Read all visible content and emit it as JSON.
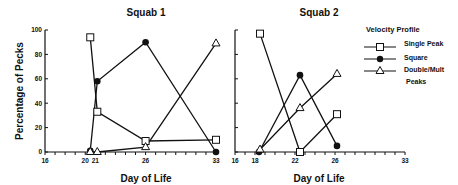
{
  "chart_data": [
    {
      "type": "line",
      "title": "Squab 1",
      "xlabel": "Day of Life",
      "ylabel": "Percentage of Pecks",
      "xlim": [
        16,
        33
      ],
      "ylim": [
        0,
        100
      ],
      "xticks": [
        16,
        20,
        21,
        26,
        33
      ],
      "yticks": [
        0,
        20,
        40,
        60,
        80,
        100
      ],
      "grid": false,
      "series": [
        {
          "name": "Single Peak",
          "marker": "open-square",
          "x": [
            20.5,
            21.2,
            26,
            33
          ],
          "values": [
            94,
            33,
            9,
            10
          ]
        },
        {
          "name": "Square",
          "marker": "filled-circle",
          "x": [
            20.5,
            21.2,
            26,
            33
          ],
          "values": [
            1,
            58,
            90,
            0
          ]
        },
        {
          "name": "Double/Mult Peaks",
          "marker": "open-triangle",
          "x": [
            20.5,
            21.2,
            26,
            33
          ],
          "values": [
            0,
            0,
            4,
            89
          ]
        }
      ]
    },
    {
      "type": "line",
      "title": "Squab 2",
      "xlabel": "Day of Life",
      "ylabel": "",
      "xlim": [
        16,
        33
      ],
      "ylim": [
        0,
        100
      ],
      "xticks": [
        16,
        18,
        22,
        26,
        33
      ],
      "yticks": [
        0,
        20,
        40,
        60,
        80,
        100
      ],
      "grid": false,
      "legend_position": "right",
      "series": [
        {
          "name": "Single Peak",
          "marker": "open-square",
          "x": [
            18.5,
            22.5,
            26.2
          ],
          "values": [
            97,
            0,
            31
          ]
        },
        {
          "name": "Square",
          "marker": "filled-circle",
          "x": [
            18.4,
            22.5,
            26.2
          ],
          "values": [
            0,
            63,
            5
          ]
        },
        {
          "name": "Double/Mult Peaks",
          "marker": "open-triangle",
          "x": [
            18.5,
            22.5,
            26.2
          ],
          "values": [
            2,
            36,
            64
          ]
        }
      ]
    }
  ],
  "legend": {
    "title": "Velocity Profile",
    "items": [
      {
        "label": "Single Peak",
        "marker": "open-square"
      },
      {
        "label": "Square",
        "marker": "filled-circle"
      },
      {
        "label": "Double/Mult",
        "label2": "Peaks",
        "marker": "open-triangle"
      }
    ]
  }
}
